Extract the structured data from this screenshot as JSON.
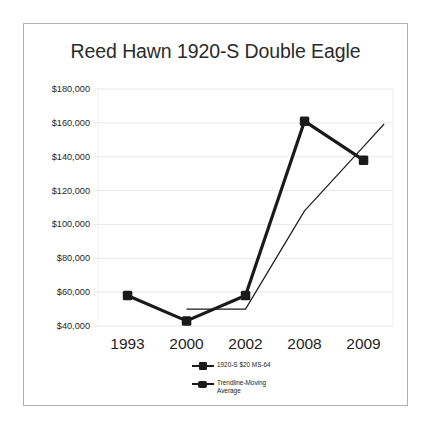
{
  "chart_data": {
    "type": "line",
    "title": "Reed Hawn 1920-S Double Eagle",
    "xlabel": "",
    "ylabel": "",
    "categories": [
      "1993",
      "2000",
      "2002",
      "2008",
      "2009"
    ],
    "x": [
      1993,
      2000,
      2002,
      2008,
      2009
    ],
    "ylim": [
      40000,
      180000
    ],
    "yticks": [
      40000,
      60000,
      80000,
      100000,
      120000,
      140000,
      160000,
      180000
    ],
    "ytick_labels": [
      "$40,000",
      "$60,000",
      "$80,000",
      "$100,000",
      "$120,000",
      "$140,000",
      "$160,000",
      "$180,000"
    ],
    "xtick_labels": [
      "1993",
      "2000",
      "2002",
      "2008",
      "2009"
    ],
    "grid": true,
    "grid_axis": "y",
    "legend_position": "bottom-center",
    "series": [
      {
        "name": "1920-S $20 MS-64",
        "values": [
          58000,
          43000,
          58000,
          161000,
          138000
        ],
        "marker": "square",
        "line_width": 3.2,
        "color": "#1a1a1a"
      },
      {
        "name": "Trendline-Moving Average",
        "values": [
          null,
          50000,
          50000,
          108000,
          146000
        ],
        "marker": "none",
        "line_width": 1.2,
        "color": "#1a1a1a",
        "note": "thin trend line beginning flat at 2000-2002 then rising past 2009"
      }
    ],
    "colors": {
      "series_primary": "#1a1a1a",
      "series_trendline": "#1a1a1a",
      "gridline": "#e8e8e8",
      "frame_border": "#b0b0b0",
      "background": "#ffffff",
      "text": "#1f1f1f"
    }
  },
  "legend": {
    "items": [
      {
        "label": "1920-S $20 MS-64"
      },
      {
        "label": "Trendline-Moving\nAverage"
      }
    ]
  }
}
